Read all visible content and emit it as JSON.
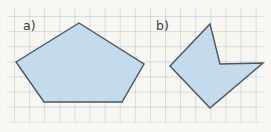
{
  "page": {
    "width": 271,
    "height": 132,
    "background_color": "#f7f6f1",
    "grid": {
      "spacing_px": 15.1,
      "line_color": "#96b2c8",
      "visible": true
    }
  },
  "figures": [
    {
      "key": "a",
      "label": "a)",
      "label_position": {
        "x": 23,
        "y": 20
      },
      "shape_name": "convex-pentagon",
      "vertex_count": 5,
      "convex": true,
      "fill_color": "#c3dbed",
      "stroke_color": "#4a5560",
      "stroke_width": 1.4,
      "points": [
        {
          "x": 16,
          "y": 62
        },
        {
          "x": 79,
          "y": 23
        },
        {
          "x": 144,
          "y": 64
        },
        {
          "x": 122,
          "y": 102
        },
        {
          "x": 44,
          "y": 102
        }
      ],
      "points_attr": "16,62 79,23 144,64 122,102 44,102"
    },
    {
      "key": "b",
      "label": "b)",
      "label_position": {
        "x": 156,
        "y": 20
      },
      "shape_name": "concave-dart",
      "vertex_count": 5,
      "convex": false,
      "fill_color": "#c3dbed",
      "stroke_color": "#4a5560",
      "stroke_width": 1.4,
      "points": [
        {
          "x": 170,
          "y": 66
        },
        {
          "x": 210,
          "y": 24
        },
        {
          "x": 220,
          "y": 64
        },
        {
          "x": 263,
          "y": 63
        },
        {
          "x": 210,
          "y": 108
        }
      ],
      "points_attr": "170,66 210,24 220,64 263,63 210,108"
    }
  ]
}
